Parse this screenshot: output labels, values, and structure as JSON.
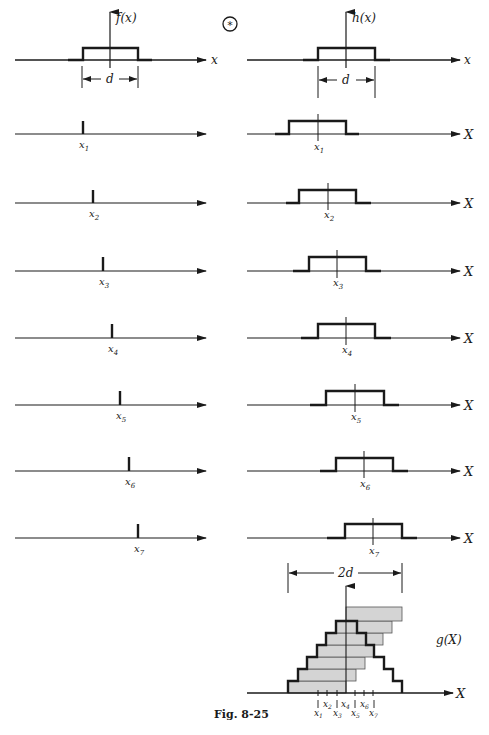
{
  "figure": {
    "caption": "Fig. 8-25",
    "star_symbol": "*"
  },
  "top_left": {
    "function_label": "f(x)",
    "axis_label": "x",
    "width_label": "d"
  },
  "top_right": {
    "function_label": "h(x)",
    "axis_label": "x",
    "width_label": "d"
  },
  "impulse_rows": [
    {
      "label": "x",
      "sub": "1"
    },
    {
      "label": "x",
      "sub": "2"
    },
    {
      "label": "x",
      "sub": "3"
    },
    {
      "label": "x",
      "sub": "4"
    },
    {
      "label": "x",
      "sub": "5"
    },
    {
      "label": "x",
      "sub": "6"
    },
    {
      "label": "x",
      "sub": "7"
    }
  ],
  "shifted_rows": {
    "axis_label": "X",
    "rows": [
      {
        "label": "x",
        "sub": "1"
      },
      {
        "label": "x",
        "sub": "2"
      },
      {
        "label": "x",
        "sub": "3"
      },
      {
        "label": "x",
        "sub": "4"
      },
      {
        "label": "x",
        "sub": "5"
      },
      {
        "label": "x",
        "sub": "6"
      },
      {
        "label": "x",
        "sub": "7"
      }
    ]
  },
  "sum_plot": {
    "function_label": "g(X)",
    "axis_label": "X",
    "width_label": "2d",
    "tick_labels_top": [
      {
        "label": "x",
        "sub": "2"
      },
      {
        "label": "x",
        "sub": "4"
      },
      {
        "label": "x",
        "sub": "6"
      }
    ],
    "tick_labels_bottom": [
      {
        "label": "x",
        "sub": "1"
      },
      {
        "label": "x",
        "sub": "3"
      },
      {
        "label": "x",
        "sub": "5"
      },
      {
        "label": "x",
        "sub": "7"
      }
    ],
    "bar_fill": "#d4d4d4"
  },
  "colors": {
    "ink": "#1a1a1a",
    "background": "#ffffff",
    "bar_fill": "#d4d4d4"
  }
}
